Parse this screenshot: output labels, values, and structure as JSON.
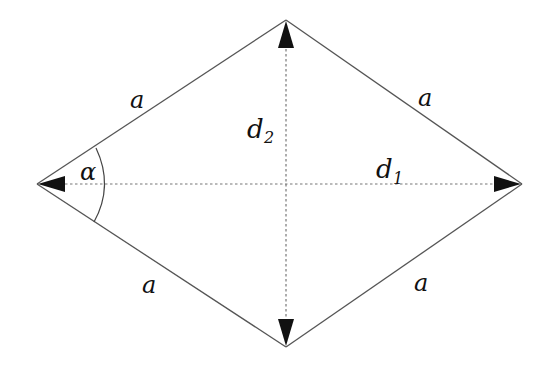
{
  "diagram": {
    "vertices": {
      "left": [
        37,
        184
      ],
      "top": [
        286,
        20
      ],
      "right": [
        522,
        184
      ],
      "bottom": [
        286,
        347
      ]
    },
    "side_labels": [
      "a",
      "a",
      "a",
      "a"
    ],
    "diagonal_labels": {
      "d1": {
        "base": "d",
        "sub": "1"
      },
      "d2": {
        "base": "d",
        "sub": "2"
      }
    },
    "angle_label": "α",
    "colors": {
      "edge": "#555555",
      "diagonal": "#777777",
      "arrow": "#111111",
      "text": "#111111"
    }
  }
}
